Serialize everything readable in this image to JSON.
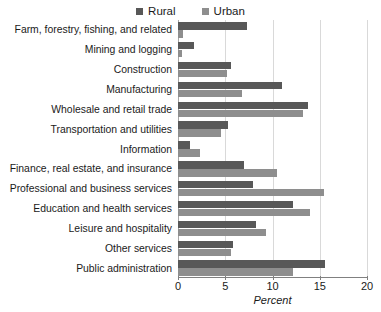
{
  "chart_data": {
    "type": "bar",
    "orientation": "horizontal",
    "title": "",
    "xlabel": "Percent",
    "ylabel": "",
    "xlim": [
      0,
      20
    ],
    "xticks": [
      0,
      5,
      10,
      15,
      20
    ],
    "grid": true,
    "legend_position": "top-center",
    "categories": [
      "Farm, forestry, fishing, and related",
      "Mining and logging",
      "Construction",
      "Manufacturing",
      "Wholesale and retail trade",
      "Transportation and utilities",
      "Information",
      "Finance, real estate, and insurance",
      "Professional and business services",
      "Education and health services",
      "Leisure and hospitality",
      "Other services",
      "Public administration"
    ],
    "series": [
      {
        "name": "Rural",
        "color": "#585858",
        "values": [
          7.3,
          1.7,
          5.6,
          11.0,
          13.8,
          5.3,
          1.3,
          7.0,
          7.9,
          12.2,
          8.3,
          5.8,
          15.6
        ]
      },
      {
        "name": "Urban",
        "color": "#8e8e8e",
        "values": [
          0.5,
          0.4,
          5.2,
          6.8,
          13.2,
          4.6,
          2.3,
          10.5,
          15.5,
          14.0,
          9.3,
          5.6,
          12.2
        ]
      }
    ]
  },
  "legend": {
    "entries": [
      {
        "label": "Rural",
        "color": "#585858"
      },
      {
        "label": "Urban",
        "color": "#8e8e8e"
      }
    ]
  }
}
